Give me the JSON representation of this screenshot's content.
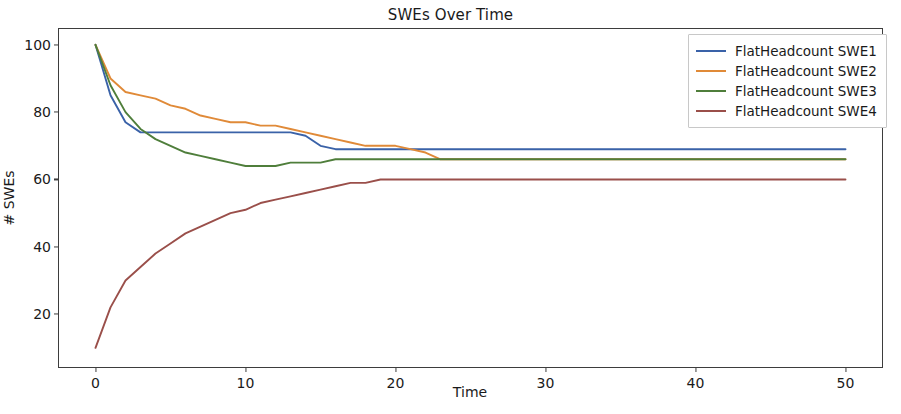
{
  "chart_data": {
    "type": "line",
    "title": "SWEs Over Time",
    "xlabel": "Time",
    "ylabel": "# SWEs",
    "xlim": [
      -2.5,
      52.5
    ],
    "ylim": [
      4,
      105
    ],
    "xticks": [
      0,
      10,
      20,
      30,
      40,
      50
    ],
    "yticks": [
      20,
      40,
      60,
      80,
      100
    ],
    "grid": false,
    "legend_position": "upper right",
    "colors": {
      "swe1": "#3a62a8",
      "swe2": "#e08a38",
      "swe3": "#4f7e3b",
      "swe4": "#9a4f4a"
    },
    "series": [
      {
        "name": "FlatHeadcount SWE1",
        "color": "#3a62a8",
        "x": [
          0,
          1,
          2,
          3,
          4,
          5,
          6,
          7,
          8,
          9,
          10,
          11,
          12,
          13,
          14,
          15,
          16,
          17,
          18,
          19,
          20,
          25,
          30,
          35,
          40,
          45,
          50
        ],
        "y": [
          100,
          85,
          77,
          74,
          74,
          74,
          74,
          74,
          74,
          74,
          74,
          74,
          74,
          74,
          73,
          70,
          69,
          69,
          69,
          69,
          69,
          69,
          69,
          69,
          69,
          69,
          69
        ]
      },
      {
        "name": "FlatHeadcount SWE2",
        "color": "#e08a38",
        "x": [
          0,
          1,
          2,
          3,
          4,
          5,
          6,
          7,
          8,
          9,
          10,
          11,
          12,
          13,
          14,
          15,
          16,
          17,
          18,
          19,
          20,
          21,
          22,
          23,
          25,
          30,
          35,
          40,
          45,
          50
        ],
        "y": [
          100,
          90,
          86,
          85,
          84,
          82,
          81,
          79,
          78,
          77,
          77,
          76,
          76,
          75,
          74,
          73,
          72,
          71,
          70,
          70,
          70,
          69,
          68,
          66,
          66,
          66,
          66,
          66,
          66,
          66
        ]
      },
      {
        "name": "FlatHeadcount SWE3",
        "color": "#4f7e3b",
        "x": [
          0,
          1,
          2,
          3,
          4,
          5,
          6,
          7,
          8,
          9,
          10,
          11,
          12,
          13,
          14,
          15,
          16,
          17,
          18,
          19,
          20,
          25,
          30,
          35,
          40,
          45,
          50
        ],
        "y": [
          100,
          88,
          80,
          75,
          72,
          70,
          68,
          67,
          66,
          65,
          64,
          64,
          64,
          65,
          65,
          65,
          66,
          66,
          66,
          66,
          66,
          66,
          66,
          66,
          66,
          66,
          66
        ]
      },
      {
        "name": "FlatHeadcount SWE4",
        "color": "#9a4f4a",
        "x": [
          0,
          1,
          2,
          3,
          4,
          5,
          6,
          7,
          8,
          9,
          10,
          11,
          12,
          13,
          14,
          15,
          16,
          17,
          18,
          19,
          20,
          25,
          30,
          35,
          40,
          45,
          50
        ],
        "y": [
          10,
          22,
          30,
          34,
          38,
          41,
          44,
          46,
          48,
          50,
          51,
          53,
          54,
          55,
          56,
          57,
          58,
          59,
          59,
          60,
          60,
          60,
          60,
          60,
          60,
          60,
          60
        ]
      }
    ]
  },
  "legend": {
    "items": [
      {
        "label": "FlatHeadcount SWE1"
      },
      {
        "label": "FlatHeadcount SWE2"
      },
      {
        "label": "FlatHeadcount SWE3"
      },
      {
        "label": "FlatHeadcount SWE4"
      }
    ]
  }
}
